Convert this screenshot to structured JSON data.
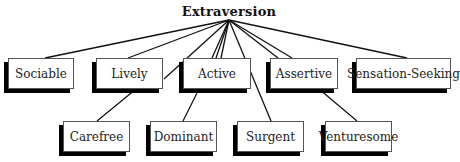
{
  "title": "Extraversion",
  "root_point": [
    229,
    20
  ],
  "nodes": [
    {
      "id": "sociable",
      "label": "Sociable",
      "x": 8,
      "y": 58,
      "w": 66,
      "h": 31,
      "anchor": [
        45,
        58
      ]
    },
    {
      "id": "lively",
      "label": "Lively",
      "x": 96,
      "y": 58,
      "w": 67,
      "h": 31,
      "anchor": [
        128,
        58
      ]
    },
    {
      "id": "active",
      "label": "Active",
      "x": 183,
      "y": 58,
      "w": 68,
      "h": 31,
      "anchor": [
        215,
        58
      ]
    },
    {
      "id": "assertive",
      "label": "Assertive",
      "x": 270,
      "y": 58,
      "w": 68,
      "h": 31,
      "anchor": [
        277,
        58
      ]
    },
    {
      "id": "sensation-seeking",
      "label": "Sensation-Seeking",
      "x": 356,
      "y": 58,
      "w": 95,
      "h": 31,
      "anchor": [
        407,
        58
      ]
    },
    {
      "id": "carefree",
      "label": "Carefree",
      "x": 63,
      "y": 121,
      "w": 67,
      "h": 31,
      "anchor": [
        97,
        121
      ]
    },
    {
      "id": "dominant",
      "label": "Dominant",
      "x": 150,
      "y": 121,
      "w": 67,
      "h": 31,
      "anchor": [
        183,
        121
      ]
    },
    {
      "id": "surgent",
      "label": "Surgent",
      "x": 237,
      "y": 121,
      "w": 67,
      "h": 31,
      "anchor": [
        271,
        121
      ]
    },
    {
      "id": "venturesome",
      "label": "Venturesome",
      "x": 325,
      "y": 121,
      "w": 67,
      "h": 31,
      "anchor": [
        357,
        121
      ]
    }
  ],
  "edges": [
    {
      "from": "root",
      "to": "sociable"
    },
    {
      "from": "root",
      "to": "lively"
    },
    {
      "from": "root",
      "to": "active",
      "offset": -3
    },
    {
      "from": "root",
      "to": "active",
      "offset": 0
    },
    {
      "from": "root",
      "to": "assertive"
    },
    {
      "from": "root",
      "to": "sensation-seeking"
    },
    {
      "from_point": [
        164,
        79
      ],
      "to_point": [
        229,
        20
      ],
      "desc": "root to carefree via lively side"
    },
    {
      "from_point": [
        223,
        20
      ],
      "to_point": [
        164,
        79
      ],
      "desc": "hidden"
    },
    {
      "from": "lively-bottom",
      "to": "carefree",
      "line": [
        [
          136,
          89
        ],
        [
          97,
          121
        ]
      ]
    },
    {
      "from": "active-bottom",
      "to": "dominant",
      "line": [
        [
          197,
          93
        ],
        [
          183,
          121
        ]
      ]
    },
    {
      "from": "root",
      "to": "surgent",
      "line": [
        [
          229,
          20
        ],
        [
          271,
          121
        ]
      ]
    },
    {
      "from": "assertive-bottom",
      "to": "venturesome",
      "line": [
        [
          319,
          89
        ],
        [
          357,
          121
        ]
      ]
    }
  ],
  "lines": [
    [
      [
        229,
        20
      ],
      [
        45,
        58
      ]
    ],
    [
      [
        229,
        20
      ],
      [
        128,
        58
      ]
    ],
    [
      [
        229,
        20
      ],
      [
        164,
        79
      ]
    ],
    [
      [
        229,
        20
      ],
      [
        212,
        58
      ]
    ],
    [
      [
        229,
        20
      ],
      [
        216,
        58
      ]
    ],
    [
      [
        229,
        20
      ],
      [
        221,
        58
      ]
    ],
    [
      [
        229,
        20
      ],
      [
        271,
        121
      ]
    ],
    [
      [
        229,
        20
      ],
      [
        278,
        58
      ]
    ],
    [
      [
        229,
        20
      ],
      [
        292,
        58
      ]
    ],
    [
      [
        229,
        20
      ],
      [
        407,
        58
      ]
    ],
    [
      [
        136,
        89
      ],
      [
        97,
        121
      ]
    ],
    [
      [
        197,
        93
      ],
      [
        183,
        121
      ]
    ],
    [
      [
        319,
        89
      ],
      [
        357,
        121
      ]
    ]
  ]
}
